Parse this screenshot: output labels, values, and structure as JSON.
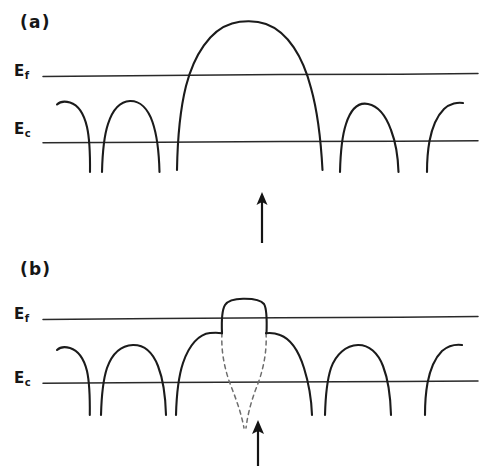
{
  "figure": {
    "background_color": "#ffffff",
    "curve_color": "#1b1b1b",
    "level_line_color": "#2a2a2a",
    "dashed_line_color": "#6e6e6e",
    "arrow_color": "#141414",
    "width": 486,
    "height": 471
  },
  "panels": [
    {
      "id": "a",
      "label": "(a)",
      "label_x": 20,
      "label_y": 12,
      "energy_levels": [
        {
          "id": "ef",
          "symbol": "E",
          "subscript": "f",
          "name": "fermi-level",
          "y": 75,
          "x_start": 43,
          "x_end": 478,
          "label_x": 14,
          "label_y": 64
        },
        {
          "id": "ec",
          "symbol": "E",
          "subscript": "c",
          "name": "conduction-band-edge",
          "y": 142,
          "x_start": 43,
          "x_end": 478,
          "label_x": 14,
          "label_y": 122
        }
      ],
      "barriers": [
        {
          "name": "partial-barrier-left-edge",
          "type": "half",
          "peak_x": 72,
          "peak_y": 104,
          "foot_x": 90,
          "foot_y": 172
        },
        {
          "name": "small-barrier-1",
          "type": "full",
          "left_foot_x": 102,
          "peak_x": 130,
          "peak_y": 101,
          "right_foot_x": 160,
          "foot_y": 172
        },
        {
          "name": "large-central-barrier",
          "type": "full",
          "left_foot_x": 177,
          "peak_x": 250,
          "peak_y": 22,
          "right_foot_x": 327,
          "foot_y": 170
        },
        {
          "name": "small-barrier-2",
          "type": "full",
          "left_foot_x": 340,
          "peak_x": 375,
          "peak_y": 104,
          "right_foot_x": 405,
          "foot_y": 172
        },
        {
          "name": "partial-barrier-right-edge",
          "type": "half",
          "peak_x": 450,
          "peak_y": 103,
          "foot_x": 422,
          "foot_y": 172
        }
      ],
      "arrow": {
        "name": "current-direction-arrow",
        "x": 262,
        "y_tail": 243,
        "y_tip": 193,
        "direction": "up"
      }
    },
    {
      "id": "b",
      "label": "(b)",
      "label_x": 20,
      "label_y": 259,
      "energy_levels": [
        {
          "id": "ef",
          "symbol": "E",
          "subscript": "f",
          "name": "fermi-level",
          "y": 318,
          "x_start": 43,
          "x_end": 478,
          "label_x": 14,
          "label_y": 307
        },
        {
          "id": "ec",
          "symbol": "E",
          "subscript": "c",
          "name": "conduction-band-edge",
          "y": 382,
          "x_start": 43,
          "x_end": 478,
          "label_x": 14,
          "label_y": 371
        }
      ],
      "barriers": [
        {
          "name": "partial-barrier-left-edge",
          "type": "half",
          "peak_x": 70,
          "peak_y": 349,
          "foot_x": 89,
          "foot_y": 415
        },
        {
          "name": "small-barrier-1",
          "type": "full",
          "left_foot_x": 101,
          "peak_x": 133,
          "peak_y": 345,
          "right_foot_x": 166,
          "foot_y": 415
        },
        {
          "name": "clipped-barrier-left-shoulder",
          "type": "full",
          "left_foot_x": 176,
          "peak_x": 213,
          "peak_y": 333,
          "right_foot_x": 236,
          "foot_y": 415
        },
        {
          "name": "clipped-barrier-right-shoulder",
          "type": "full",
          "left_foot_x": 252,
          "peak_x": 276,
          "peak_y": 333,
          "right_foot_x": 313,
          "foot_y": 415
        },
        {
          "name": "small-barrier-2",
          "type": "full",
          "left_foot_x": 325,
          "peak_x": 360,
          "peak_y": 345,
          "right_foot_x": 398,
          "foot_y": 415
        },
        {
          "name": "partial-barrier-right-edge",
          "type": "half",
          "peak_x": 448,
          "peak_y": 345,
          "foot_x": 416,
          "foot_y": 415
        }
      ],
      "plateau": {
        "name": "flat-topped-clipped-barrier",
        "left_x": 222,
        "right_x": 268,
        "top_y": 300,
        "base_y": 333,
        "description": "flat-topped barrier peak clipped above the Fermi level"
      },
      "dashed_traces": [
        {
          "name": "dashed-barrier-left-flank",
          "description": "original unclipped barrier flank, left side, extrapolated downward"
        },
        {
          "name": "dashed-barrier-right-flank",
          "description": "original unclipped barrier flank, right side, extrapolated downward"
        }
      ],
      "arrow": {
        "name": "current-direction-arrow",
        "x": 258,
        "y_tail": 466,
        "y_tip": 421,
        "direction": "up"
      }
    }
  ]
}
